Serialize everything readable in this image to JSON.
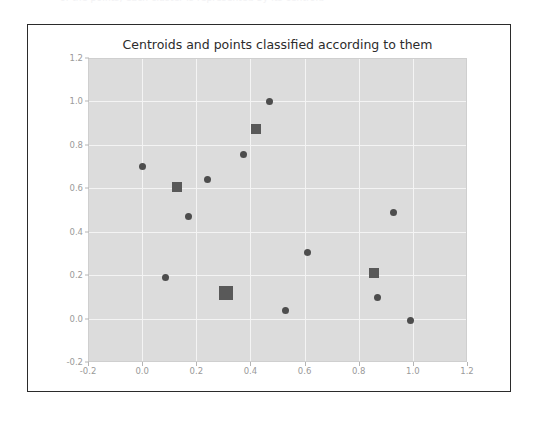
{
  "top_strip": {
    "ghost_text": "of the points; each cluster is represented by its centroid"
  },
  "figure": {
    "background_color": "#ffffff",
    "frame_color": "#2b2b2b",
    "plot_background_color": "#dcdcdc",
    "grid_color": "#f4f4f4",
    "marker_color": "#4d4d4d",
    "centroid_color": "#595959"
  },
  "chart_data": {
    "type": "scatter",
    "title": "Centroids and points classified according to them",
    "xlabel": "",
    "ylabel": "",
    "xlim": [
      -0.2,
      1.2
    ],
    "ylim": [
      -0.2,
      1.2
    ],
    "grid": true,
    "legend": "none",
    "xticks": [
      "-0.2",
      "0.0",
      "0.2",
      "0.4",
      "0.6",
      "0.8",
      "1.0",
      "1.2"
    ],
    "xtick_values": [
      -0.2,
      0.0,
      0.2,
      0.4,
      0.6,
      0.8,
      1.0,
      1.2
    ],
    "yticks": [
      "-0.2",
      "0.0",
      "0.2",
      "0.4",
      "0.6",
      "0.8",
      "1.0",
      "1.2"
    ],
    "ytick_values": [
      -0.2,
      0.0,
      0.2,
      0.4,
      0.6,
      0.8,
      1.0,
      1.2
    ],
    "series": [
      {
        "name": "points",
        "marker": "circle",
        "color": "#4d4d4d",
        "size": 7,
        "x": [
          0.0,
          0.17,
          0.24,
          0.375,
          0.47,
          0.085,
          0.61,
          0.53,
          0.87,
          0.93,
          0.99
        ],
        "y": [
          0.7,
          0.47,
          0.64,
          0.755,
          1.0,
          0.19,
          0.305,
          0.035,
          0.095,
          0.49,
          -0.01
        ]
      },
      {
        "name": "centroids",
        "marker": "square",
        "color": "#595959",
        "size": 10,
        "x": [
          0.13,
          0.42,
          0.855
        ],
        "y": [
          0.605,
          0.875,
          0.21
        ]
      },
      {
        "name": "centroid-large",
        "marker": "square",
        "color": "#595959",
        "size": 14,
        "x": [
          0.31
        ],
        "y": [
          0.12
        ]
      }
    ]
  }
}
